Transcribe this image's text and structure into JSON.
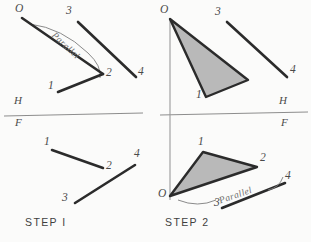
{
  "figure": {
    "type": "technical-drawing",
    "background_color": "#fbfbfa",
    "ink_color": "#2b2b2b",
    "thin_line_color": "#8d8d8d",
    "fill_color": "#b9b9b9"
  },
  "panels": [
    {
      "id": "step1",
      "caption": "STEP  I",
      "caption_pos": {
        "x": 25,
        "y": 222
      },
      "reference_line": {
        "name": "HF-fold-line",
        "upper_label": "H",
        "lower_label": "F",
        "upper_label_pos": {
          "x": 14,
          "y": 101
        },
        "lower_label_pos": {
          "x": 15,
          "y": 122
        },
        "x1": 4,
        "y1": 116,
        "x2": 143,
        "y2": 113
      },
      "annotation": {
        "text": "Parallel",
        "pos": {
          "x": 56,
          "y": 31
        },
        "rotation_deg": 43
      },
      "points": [
        {
          "label": "O",
          "x": 22,
          "y": 18,
          "label_pos": {
            "x": 15,
            "y": 9
          }
        },
        {
          "label": "1",
          "x": 58,
          "y": 92,
          "label_pos": {
            "x": 48,
            "y": 86
          }
        },
        {
          "label": "2",
          "x": 103,
          "y": 74,
          "label_pos": {
            "x": 106,
            "y": 73
          }
        },
        {
          "label": "3",
          "x": 78,
          "y": 22,
          "label_pos": {
            "x": 66,
            "y": 11
          }
        },
        {
          "label": "4",
          "x": 136,
          "y": 77,
          "label_pos": {
            "x": 138,
            "y": 71
          }
        },
        {
          "label": "1",
          "x": 52,
          "y": 150,
          "label_pos": {
            "x": 44,
            "y": 141
          }
        },
        {
          "label": "2",
          "x": 103,
          "y": 168,
          "label_pos": {
            "x": 106,
            "y": 165
          }
        },
        {
          "label": "3",
          "x": 75,
          "y": 203,
          "label_pos": {
            "x": 62,
            "y": 197
          }
        },
        {
          "label": "4",
          "x": 135,
          "y": 165,
          "label_pos": {
            "x": 134,
            "y": 152
          }
        }
      ],
      "segments": [
        {
          "name": "top-O-2",
          "x1": 22,
          "y1": 18,
          "x2": 103,
          "y2": 74,
          "weight": "heavy"
        },
        {
          "name": "top-2-1",
          "x1": 103,
          "y1": 74,
          "x2": 58,
          "y2": 92,
          "weight": "heavy"
        },
        {
          "name": "top-3-4",
          "x1": 78,
          "y1": 22,
          "x2": 136,
          "y2": 77,
          "weight": "heavy"
        },
        {
          "name": "bottom-1-2",
          "x1": 52,
          "y1": 150,
          "x2": 103,
          "y2": 168,
          "weight": "heavy"
        },
        {
          "name": "bottom-3-4",
          "x1": 75,
          "y1": 203,
          "x2": 135,
          "y2": 165,
          "weight": "heavy"
        }
      ],
      "arcs": [
        {
          "name": "parallel-arc-top",
          "d": "M 30 24 Q 62 28 88 53 Q 102 66 100 78"
        }
      ]
    },
    {
      "id": "step2",
      "caption": "STEP  2",
      "caption_pos": {
        "x": 165,
        "y": 222
      },
      "reference_line": {
        "name": "HF-fold-line",
        "upper_label": "H",
        "lower_label": "F",
        "upper_label_pos": {
          "x": 279,
          "y": 101
        },
        "lower_label_pos": {
          "x": 281,
          "y": 122
        },
        "x1": 160,
        "y1": 115,
        "x2": 308,
        "y2": 112
      },
      "vertical_line": {
        "name": "projector-through-O",
        "x1": 170,
        "y1": 18,
        "x2": 170,
        "y2": 200
      },
      "annotation": {
        "text": "Parallel",
        "pos": {
          "x": 218,
          "y": 197
        },
        "rotation_deg": -19
      },
      "points": [
        {
          "label": "O",
          "x": 170,
          "y": 19,
          "label_pos": {
            "x": 161,
            "y": 9
          }
        },
        {
          "label": "1",
          "x": 206,
          "y": 97,
          "label_pos": {
            "x": 196,
            "y": 96
          }
        },
        {
          "label": "3",
          "x": 227,
          "y": 22,
          "label_pos": {
            "x": 215,
            "y": 12
          }
        },
        {
          "label": "4",
          "x": 287,
          "y": 77,
          "label_pos": {
            "x": 290,
            "y": 70
          }
        },
        {
          "label": "O",
          "x": 170,
          "y": 196,
          "label_pos": {
            "x": 159,
            "y": 194
          }
        },
        {
          "label": "1",
          "x": 203,
          "y": 152,
          "label_pos": {
            "x": 198,
            "y": 142
          }
        },
        {
          "label": "2",
          "x": 257,
          "y": 167,
          "label_pos": {
            "x": 260,
            "y": 158
          }
        },
        {
          "label": "3",
          "x": 222,
          "y": 208,
          "label_pos": {
            "x": 214,
            "y": 202
          }
        },
        {
          "label": "4",
          "x": 285,
          "y": 183,
          "label_pos": {
            "x": 285,
            "y": 175
          }
        }
      ],
      "triangles": [
        {
          "name": "upper-triangle-O-1-2",
          "points": "170,19 206,97 248,80",
          "filled": true
        },
        {
          "name": "lower-triangle-O-1-2",
          "points": "170,196 203,152 257,167",
          "filled": true
        }
      ],
      "segments": [
        {
          "name": "top-3-4",
          "x1": 227,
          "y1": 22,
          "x2": 287,
          "y2": 77,
          "weight": "heavy"
        },
        {
          "name": "bottom-3-4",
          "x1": 222,
          "y1": 208,
          "x2": 285,
          "y2": 183,
          "weight": "heavy"
        }
      ],
      "arcs": [
        {
          "name": "parallel-arc-bottom",
          "d": "M 178 200 Q 198 208 216 200"
        },
        {
          "name": "parallel-arc-bottom-right",
          "d": "M 268 190 Q 278 188 282 178"
        }
      ]
    }
  ]
}
